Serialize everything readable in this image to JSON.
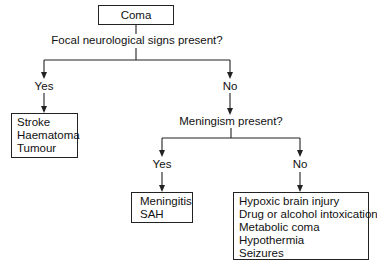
{
  "diagram": {
    "type": "flowchart",
    "root": {
      "label": "Coma"
    },
    "question1": {
      "label": "Focal neurological signs present?"
    },
    "q1_yes": {
      "label": "Yes"
    },
    "q1_no": {
      "label": "No"
    },
    "focal_causes": {
      "items": [
        "Stroke",
        "Haematoma",
        "Tumour"
      ]
    },
    "question2": {
      "label": "Meningism present?"
    },
    "q2_yes": {
      "label": "Yes"
    },
    "q2_no": {
      "label": "No"
    },
    "meningism_causes": {
      "items": [
        "Meningitis",
        "SAH"
      ]
    },
    "other_causes": {
      "items": [
        "Hypoxic brain injury",
        "Drug or alcohol intoxication",
        "Metabolic coma",
        "Hypothermia",
        "Seizures"
      ]
    }
  },
  "colors": {
    "line": "#222222",
    "text": "#111111",
    "background": "#ffffff"
  }
}
